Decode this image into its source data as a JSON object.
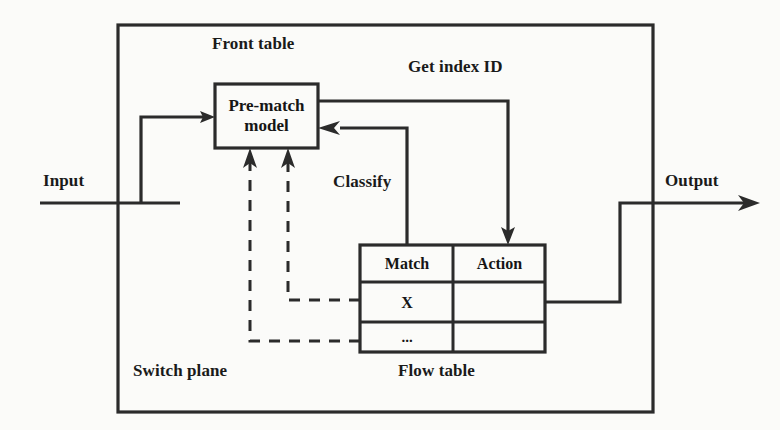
{
  "diagram": {
    "title_labels": {
      "front_table": "Front table",
      "get_index_id": "Get index ID",
      "classify": "Classify",
      "switch_plane": "Switch plane",
      "flow_table": "Flow table"
    },
    "ports": {
      "input": "Input",
      "output": "Output"
    },
    "prematch_box": {
      "line1": "Pre-match",
      "line2": "model"
    },
    "flow_table": {
      "headers": [
        "Match",
        "Action"
      ],
      "rows": [
        {
          "match": "X",
          "action": ""
        },
        {
          "match": "...",
          "action": ""
        }
      ]
    },
    "colors": {
      "line": "#2b2b2b",
      "text": "#151515",
      "background": "#fbfbf9"
    }
  }
}
